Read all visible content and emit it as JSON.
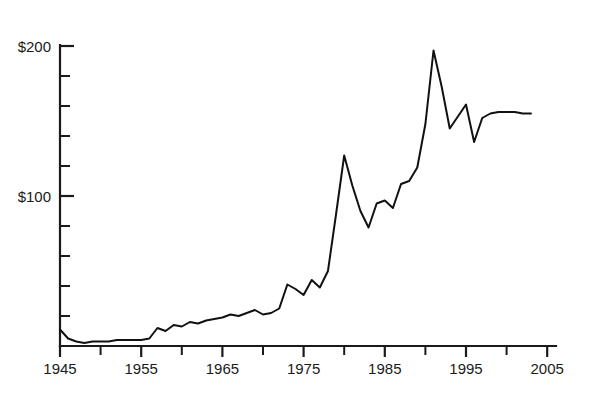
{
  "chart_data": {
    "type": "line",
    "title": "",
    "subtitle": "",
    "xlabel": "",
    "ylabel": "",
    "xlim": [
      1945,
      2007
    ],
    "ylim": [
      0,
      200
    ],
    "grid": false,
    "legend": null,
    "y_tick_labels": [
      "$200",
      "$100"
    ],
    "y_tick_values": [
      200,
      100
    ],
    "y_minor_tick_values": [
      180,
      160,
      140,
      120,
      80,
      60,
      40,
      20
    ],
    "x_tick_labels": [
      "1945",
      "1955",
      "1965",
      "1975",
      "1985",
      "1995",
      "2005"
    ],
    "x_tick_values": [
      1945,
      1955,
      1965,
      1975,
      1985,
      1995,
      2005
    ],
    "x_minor_tick_values": [
      1950,
      1960,
      1970,
      1980,
      1990,
      2000
    ],
    "series": [
      {
        "name": "value",
        "color": "#111111",
        "x": [
          1945,
          1946,
          1947,
          1948,
          1949,
          1950,
          1951,
          1952,
          1953,
          1954,
          1955,
          1956,
          1957,
          1958,
          1959,
          1960,
          1961,
          1962,
          1963,
          1964,
          1965,
          1966,
          1967,
          1968,
          1969,
          1970,
          1971,
          1972,
          1973,
          1974,
          1975,
          1976,
          1977,
          1978,
          1979,
          1980,
          1981,
          1982,
          1983,
          1984,
          1985,
          1986,
          1987,
          1988,
          1989,
          1990,
          1991,
          1992,
          1993,
          1994,
          1995,
          1996,
          1997,
          1998,
          1999,
          2000,
          2001,
          2002,
          2003
        ],
        "values": [
          11,
          5,
          3,
          2,
          3,
          3,
          3,
          4,
          4,
          4,
          4,
          5,
          12,
          10,
          14,
          13,
          16,
          15,
          17,
          18,
          19,
          21,
          20,
          22,
          24,
          21,
          22,
          25,
          41,
          38,
          34,
          44,
          39,
          50,
          88,
          127,
          107,
          90,
          79,
          95,
          97,
          92,
          108,
          110,
          119,
          148,
          197,
          173,
          145,
          153,
          161,
          136,
          152,
          155,
          156,
          156,
          156,
          155,
          155
        ]
      }
    ]
  },
  "axis": {
    "y_label_200": "$200",
    "y_label_100": "$100",
    "x_label_1945": "1945",
    "x_label_1955": "1955",
    "x_label_1965": "1965",
    "x_label_1975": "1975",
    "x_label_1985": "1985",
    "x_label_1995": "1995",
    "x_label_2005": "2005"
  },
  "colors": {
    "background": "#ffffff",
    "line": "#111111",
    "axis": "#1a1a1a",
    "text": "#1a1a1a"
  }
}
